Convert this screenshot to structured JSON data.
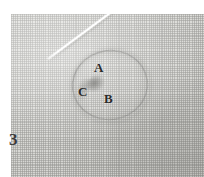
{
  "figure": {
    "panel_number": "3",
    "background_color": "#dcdcd8",
    "needle_color": "#ffffff",
    "annotation_color": "#2b2b2b"
  },
  "annotations": [
    {
      "id": "A",
      "label": "A",
      "description": "upper region inside marked outline"
    },
    {
      "id": "B",
      "label": "B",
      "description": "lower right region inside marked outline"
    },
    {
      "id": "C",
      "label": "C",
      "description": "left region at darker smudge"
    }
  ],
  "elements": {
    "weave_texture_name": "woven-cloth-texture",
    "region_outline_name": "marked-region-outline",
    "needle_name": "needle",
    "defect_name": "fabric-defect-smudge"
  }
}
